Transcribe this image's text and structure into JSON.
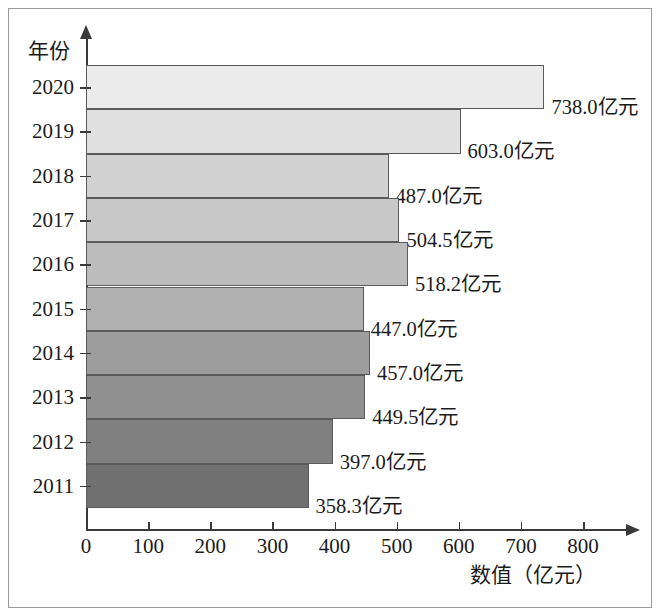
{
  "chart_data": {
    "type": "bar",
    "orientation": "horizontal",
    "title": "",
    "xlabel": "数值（亿元）",
    "ylabel": "年份",
    "xlim": [
      0,
      800
    ],
    "xticks": [
      0,
      100,
      200,
      300,
      400,
      500,
      600,
      700,
      800
    ],
    "xtick_labels": [
      "0",
      "100",
      "200",
      "300",
      "400",
      "500",
      "600",
      "700",
      "800"
    ],
    "grid": false,
    "legend": null,
    "categories": [
      "2020",
      "2019",
      "2018",
      "2017",
      "2016",
      "2015",
      "2014",
      "2013",
      "2012",
      "2011"
    ],
    "values": [
      738.0,
      603.0,
      487.0,
      504.5,
      518.2,
      447.0,
      457.0,
      449.5,
      397.0,
      358.3
    ],
    "data_labels": [
      "738.0亿元",
      "603.0亿元",
      "487.0亿元",
      "504.5亿元",
      "518.2亿元",
      "447.0亿元",
      "457.0亿元",
      "449.5亿元",
      "397.0亿元",
      "358.3亿元"
    ],
    "bar_colors": [
      "#ebebeb",
      "#e0e0e0",
      "#d2d2d2",
      "#c8c8c8",
      "#bcbcbc",
      "#b0b0b0",
      "#9d9d9d",
      "#909090",
      "#808080",
      "#707070"
    ],
    "bar_border_color": "#5b5b5b",
    "axis_color": "#3a3a3a",
    "background_color": "#ffffff"
  }
}
